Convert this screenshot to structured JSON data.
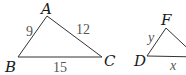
{
  "figure": {
    "triangles": [
      {
        "name": "ABC",
        "vertices": {
          "A": "A",
          "B": "B",
          "C": "C"
        },
        "sides": {
          "AB": "9",
          "AC": "12",
          "BC": "15"
        }
      },
      {
        "name": "DEF",
        "vertices": {
          "D": "D",
          "F": "F"
        },
        "sides": {
          "DF": "y",
          "DE": "x"
        }
      }
    ],
    "colors": {
      "line": "#333333",
      "vertex_label": "#1a1a1a",
      "side_label": "#555555"
    }
  }
}
